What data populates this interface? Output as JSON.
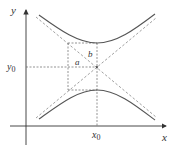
{
  "diagram": {
    "labels": {
      "x_axis": "x",
      "y_axis": "y",
      "x0": "x",
      "x0_sub": "0",
      "y0": "y",
      "y0_sub": "0",
      "a": "a",
      "b": "b"
    },
    "colors": {
      "curve": "#555555",
      "dashed": "#888888",
      "axis": "#333333"
    },
    "geometry": {
      "center": [
        97,
        67
      ],
      "a": 29,
      "b": 24
    }
  }
}
